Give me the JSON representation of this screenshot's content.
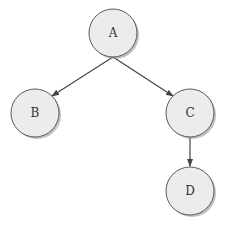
{
  "diagram": {
    "type": "tree",
    "colors": {
      "node_fill": "#ececec",
      "node_stroke": "#5a5a5a",
      "node_shadow": "#9a9a9a",
      "edge": "#444444",
      "label": "#333333"
    },
    "nodes": [
      {
        "id": "A",
        "label": "A",
        "cx": 113,
        "cy": 33,
        "r": 24
      },
      {
        "id": "B",
        "label": "B",
        "cx": 35,
        "cy": 113,
        "r": 24
      },
      {
        "id": "C",
        "label": "C",
        "cx": 190,
        "cy": 113,
        "r": 24
      },
      {
        "id": "D",
        "label": "D",
        "cx": 190,
        "cy": 191,
        "r": 24
      }
    ],
    "edges": [
      {
        "from": "A",
        "to": "B",
        "x1": 113,
        "y1": 57,
        "x2": 52,
        "y2": 96
      },
      {
        "from": "A",
        "to": "C",
        "x1": 113,
        "y1": 57,
        "x2": 173,
        "y2": 96
      },
      {
        "from": "C",
        "to": "D",
        "x1": 190,
        "y1": 137,
        "x2": 190,
        "y2": 166
      }
    ]
  }
}
